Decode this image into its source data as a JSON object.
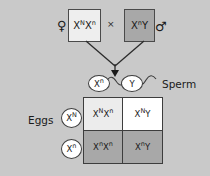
{
  "diagram": {
    "background_color": "#c9c9c9",
    "symbols": {
      "female": "♀",
      "male": "♂",
      "cross": "×"
    },
    "parents": {
      "female": {
        "genotype_base": "X",
        "alleles": [
          {
            "letter": "X",
            "superscript": "N"
          },
          {
            "letter": "X",
            "superscript": "n"
          }
        ],
        "fill_color": "#eeeeee"
      },
      "male": {
        "alleles": [
          {
            "letter": "X",
            "superscript": "n"
          },
          {
            "letter": "Y",
            "superscript": ""
          }
        ],
        "fill_color": "#a8a8a8"
      }
    },
    "gametes": {
      "sperm_label": "Sperm",
      "sperm": [
        {
          "letter": "X",
          "superscript": "n"
        },
        {
          "letter": "Y",
          "superscript": ""
        }
      ],
      "eggs_label": "Eggs",
      "eggs": [
        {
          "letter": "X",
          "superscript": "N"
        },
        {
          "letter": "X",
          "superscript": "n"
        }
      ]
    },
    "punnett": {
      "cells": [
        {
          "position": "top-left",
          "alleles": [
            {
              "letter": "X",
              "superscript": "N"
            },
            {
              "letter": "X",
              "superscript": "n"
            }
          ],
          "fill_color": "#ececec"
        },
        {
          "position": "top-right",
          "alleles": [
            {
              "letter": "X",
              "superscript": "N"
            },
            {
              "letter": "Y",
              "superscript": ""
            }
          ],
          "fill_color": "#ffffff"
        },
        {
          "position": "bottom-left",
          "alleles": [
            {
              "letter": "X",
              "superscript": "n"
            },
            {
              "letter": "X",
              "superscript": "n"
            }
          ],
          "fill_color": "#a8a8a8"
        },
        {
          "position": "bottom-right",
          "alleles": [
            {
              "letter": "X",
              "superscript": "n"
            },
            {
              "letter": "Y",
              "superscript": ""
            }
          ],
          "fill_color": "#a8a8a8"
        }
      ]
    }
  }
}
